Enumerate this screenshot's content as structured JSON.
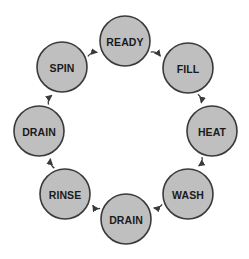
{
  "diagram": {
    "type": "cycle",
    "direction": "clockwise",
    "background_color": "#ffffff",
    "node_fill_color": "#bfbfbf",
    "node_stroke_color": "#3a3a3a",
    "label_color": "#1a1a1a",
    "edge_color": "#3a3a3a",
    "node_radius": 25,
    "center": {
      "x": 125,
      "y": 130
    },
    "orbit_radius": 88,
    "nodes": [
      {
        "id": "ready",
        "label": "READY",
        "cx": 125,
        "cy": 41,
        "r": 25
      },
      {
        "id": "fill",
        "label": "FILL",
        "cx": 188,
        "cy": 68,
        "r": 25
      },
      {
        "id": "heat",
        "label": "HEAT",
        "cx": 212,
        "cy": 131,
        "r": 25
      },
      {
        "id": "wash",
        "label": "WASH",
        "cx": 188,
        "cy": 194,
        "r": 25
      },
      {
        "id": "drain_bottom",
        "label": "DRAIN",
        "cx": 126,
        "cy": 219,
        "r": 25
      },
      {
        "id": "rinse",
        "label": "RINSE",
        "cx": 65,
        "cy": 194,
        "r": 25
      },
      {
        "id": "drain_left",
        "label": "DRAIN",
        "cx": 39,
        "cy": 131,
        "r": 25
      },
      {
        "id": "spin",
        "label": "SPIN",
        "cx": 62,
        "cy": 67,
        "r": 25
      }
    ],
    "edges": [
      {
        "id": "ready-fill",
        "from": "ready",
        "to": "fill",
        "label": ""
      },
      {
        "id": "fill-heat",
        "from": "fill",
        "to": "heat",
        "label": ""
      },
      {
        "id": "heat-wash",
        "from": "heat",
        "to": "wash",
        "label": ""
      },
      {
        "id": "wash-drain",
        "from": "wash",
        "to": "drain_bottom",
        "label": ""
      },
      {
        "id": "drain-rinse",
        "from": "drain_bottom",
        "to": "rinse",
        "label": ""
      },
      {
        "id": "rinse-drain",
        "from": "rinse",
        "to": "drain_left",
        "label": ""
      },
      {
        "id": "drain-spin",
        "from": "drain_left",
        "to": "spin",
        "label": ""
      },
      {
        "id": "spin-ready",
        "from": "spin",
        "to": "ready",
        "label": ""
      }
    ]
  }
}
